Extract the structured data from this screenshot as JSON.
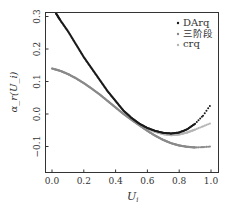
{
  "chart_data": {
    "type": "scatter",
    "title": "",
    "xlabel": "U_i",
    "ylabel": "α_r(U_i)",
    "xlim": [
      -0.04,
      1.04
    ],
    "ylim": [
      -0.18,
      0.32
    ],
    "xticks": [
      0.0,
      0.2,
      0.4,
      0.6,
      0.8,
      1.0
    ],
    "xtick_labels": [
      "0.0",
      "0.2",
      "0.4",
      "0.6",
      "0.8",
      "1.0"
    ],
    "yticks": [
      -0.1,
      0.0,
      0.1,
      0.2,
      0.3
    ],
    "ytick_labels": [
      "−0.1",
      "0.0",
      "0.1",
      "0.2",
      "0.3"
    ],
    "grid": false,
    "legend_position": "upper right",
    "series": [
      {
        "name": "DArq",
        "color": "#1a1a1a",
        "x": [
          0.025,
          0.05,
          0.1,
          0.15,
          0.2,
          0.25,
          0.3,
          0.35,
          0.4,
          0.45,
          0.5,
          0.55,
          0.6,
          0.65,
          0.7,
          0.75,
          0.8,
          0.85,
          0.9,
          0.95,
          1.0
        ],
        "y": [
          0.31,
          0.29,
          0.255,
          0.215,
          0.175,
          0.14,
          0.105,
          0.07,
          0.04,
          0.01,
          -0.012,
          -0.03,
          -0.043,
          -0.052,
          -0.058,
          -0.06,
          -0.057,
          -0.047,
          -0.03,
          -0.005,
          0.03
        ]
      },
      {
        "name": "三阶段",
        "color": "#8a8a8a",
        "x": [
          0.0,
          0.05,
          0.1,
          0.15,
          0.2,
          0.25,
          0.3,
          0.35,
          0.4,
          0.45,
          0.5,
          0.55,
          0.6,
          0.65,
          0.7,
          0.75,
          0.8,
          0.85,
          0.9,
          0.95,
          1.0
        ],
        "y": [
          0.14,
          0.133,
          0.123,
          0.11,
          0.095,
          0.078,
          0.06,
          0.04,
          0.02,
          0.0,
          -0.018,
          -0.035,
          -0.052,
          -0.067,
          -0.08,
          -0.09,
          -0.097,
          -0.101,
          -0.103,
          -0.102,
          -0.1
        ]
      },
      {
        "name": "crq",
        "color": "#b5b5b5",
        "x": [
          0.025,
          0.05,
          0.1,
          0.15,
          0.2,
          0.25,
          0.3,
          0.35,
          0.4,
          0.45,
          0.5,
          0.55,
          0.6,
          0.65,
          0.7,
          0.75,
          0.8,
          0.85,
          0.9,
          0.95,
          1.0
        ],
        "y": [
          0.31,
          0.29,
          0.255,
          0.215,
          0.175,
          0.14,
          0.105,
          0.07,
          0.04,
          0.01,
          -0.012,
          -0.03,
          -0.045,
          -0.055,
          -0.062,
          -0.065,
          -0.063,
          -0.057,
          -0.048,
          -0.038,
          -0.028
        ]
      }
    ]
  },
  "legend": {
    "items": [
      {
        "label": "DArq",
        "color": "#1a1a1a"
      },
      {
        "label": "三阶段",
        "color": "#8a8a8a"
      },
      {
        "label": "crq",
        "color": "#b5b5b5"
      }
    ]
  },
  "axes": {
    "xlabel_main": "U",
    "xlabel_sub": "i",
    "ylabel": "α_r(U_i)"
  }
}
